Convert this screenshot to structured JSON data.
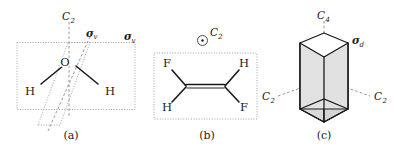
{
  "figure": {
    "background_color": "#ffffff",
    "ink_color": "#1a1a1a",
    "dotted_plane_color": "#9a9a9a",
    "dashed_axis_color": "#8c8c8c",
    "prism_fill_color": "#d9d9d9",
    "prism_top_fill_color": "#ffffff",
    "prism_plane_fill_color": "#e6e6e6"
  },
  "panels": [
    {
      "id": "a",
      "caption": "(a)",
      "molecule": "water",
      "atoms": [
        {
          "label": "O",
          "name": "atom-oxygen"
        },
        {
          "label": "H",
          "name": "atom-hydrogen-left"
        },
        {
          "label": "H",
          "name": "atom-hydrogen-right"
        }
      ],
      "symmetry_elements": [
        {
          "symbol": "C",
          "subscript": "2",
          "name": "c2-axis",
          "kind": "rotation-axis"
        },
        {
          "symbol": "σ",
          "subscript": "v",
          "name": "sigma-v-plane-inclined",
          "kind": "mirror-plane"
        },
        {
          "symbol": "σ",
          "subscript": "v",
          "name": "sigma-v-plane-molecular",
          "kind": "mirror-plane"
        }
      ]
    },
    {
      "id": "b",
      "caption": "(b)",
      "molecule": "trans-1,2-difluoroethene",
      "atoms": [
        {
          "label": "F",
          "name": "atom-fluorine-top-left"
        },
        {
          "label": "H",
          "name": "atom-hydrogen-top-right"
        },
        {
          "label": "H",
          "name": "atom-hydrogen-bottom-left"
        },
        {
          "label": "F",
          "name": "atom-fluorine-bottom-right"
        }
      ],
      "symmetry_elements": [
        {
          "symbol": "C",
          "subscript": "2",
          "name": "c2-axis-out-of-plane",
          "kind": "rotation-axis-perpendicular"
        }
      ]
    },
    {
      "id": "c",
      "caption": "(c)",
      "molecule": "square-prism",
      "atoms": [],
      "symmetry_elements": [
        {
          "symbol": "C",
          "subscript": "4",
          "name": "c4-axis",
          "kind": "rotation-axis"
        },
        {
          "symbol": "σ",
          "subscript": "d",
          "name": "sigma-d-plane",
          "kind": "mirror-plane-dihedral"
        },
        {
          "symbol": "C",
          "subscript": "2",
          "name": "c2-axis-left",
          "kind": "rotation-axis"
        },
        {
          "symbol": "C",
          "subscript": "2",
          "name": "c2-axis-right",
          "kind": "rotation-axis"
        }
      ]
    }
  ]
}
